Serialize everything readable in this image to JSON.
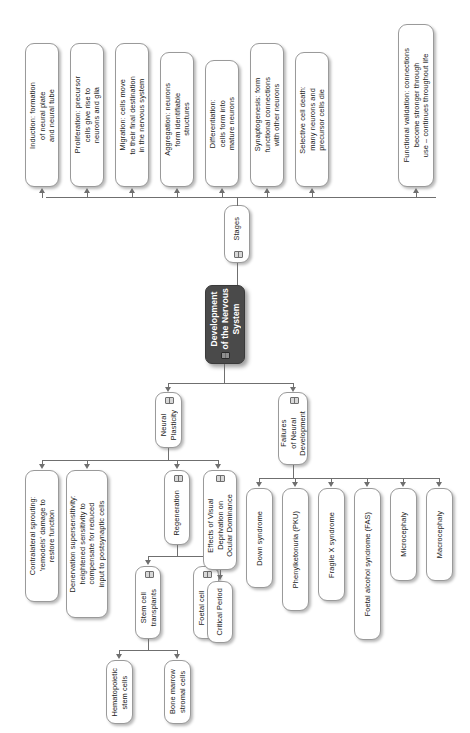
{
  "diagram": {
    "title": "Development of the Nervous System",
    "orientation": "rotated-90-ccw",
    "root": {
      "label": "Development\nof the Nervous\nSystem",
      "icon": "book-icon"
    },
    "branches": {
      "stages": {
        "label": "Stages",
        "icon": "book-icon",
        "items": [
          {
            "label": "Induction: formation\nof neural plate\nand neural tube"
          },
          {
            "label": "Proliferation: precursor\ncells give rise to\nneurons and glia"
          },
          {
            "label": "Migration: cells move\nto their final destination\nin the nervous system"
          },
          {
            "label": "Aggregation: neurons\nform identifiable\nstructures"
          },
          {
            "label": "Differentiation:\ncells form into\nmature neurons"
          },
          {
            "label": "Synaptogenesis: form\nfunctional connections\nwith other neurons"
          },
          {
            "label": "Selective cell death:\nmany neurons and\nprecursor cells die"
          },
          {
            "label": "Functional validation: connections\nbecome stronger through\nuse – continues throughout life"
          }
        ]
      },
      "plasticity": {
        "label": "Neural\nPlasticity",
        "icon": "book-icon",
        "items": [
          {
            "label": "Contralateral sprouting:\n'remodels' damage to\nrestore function"
          },
          {
            "label": "Denervation supersensitivity:\nheightened sensitivity to\ncompensate for reduced\ninput to postsynaptic cells"
          },
          {
            "label": "Regeneration",
            "icon": "book-icon",
            "children": [
              {
                "label": "Stem cell\ntransplants",
                "icon": "book-icon",
                "children": [
                  {
                    "label": "Hematopoietic\nstem cells"
                  },
                  {
                    "label": "Bone marrow\nstromal cells"
                  }
                ]
              },
              {
                "label": "Foetal cell\ntransplants",
                "icon": "book-icon"
              }
            ]
          },
          {
            "label": "Effects of Visual\nDeprivation on\nOcular Dominance",
            "icon": "book-icon",
            "children": [
              {
                "label": "Critical Period"
              }
            ]
          }
        ]
      },
      "failures": {
        "label": "Failures\nof Neural\nDevelopment",
        "icon": "book-icon",
        "items": [
          {
            "label": "Down syndrome"
          },
          {
            "label": "Phenylketonuria (PKU)"
          },
          {
            "label": "Fragile X syndrome"
          },
          {
            "label": "Foetal alcohol syndrome (FAS)"
          },
          {
            "label": "Microcephaly"
          },
          {
            "label": "Macrocephaly"
          }
        ]
      }
    },
    "colors": {
      "root_fill": "#4a4a4a",
      "root_text": "#ffffff",
      "node_fill": "#ffffff",
      "node_border": "#9a9a9a",
      "connector": "#6f6f6f",
      "text": "#1a1a1a"
    }
  }
}
